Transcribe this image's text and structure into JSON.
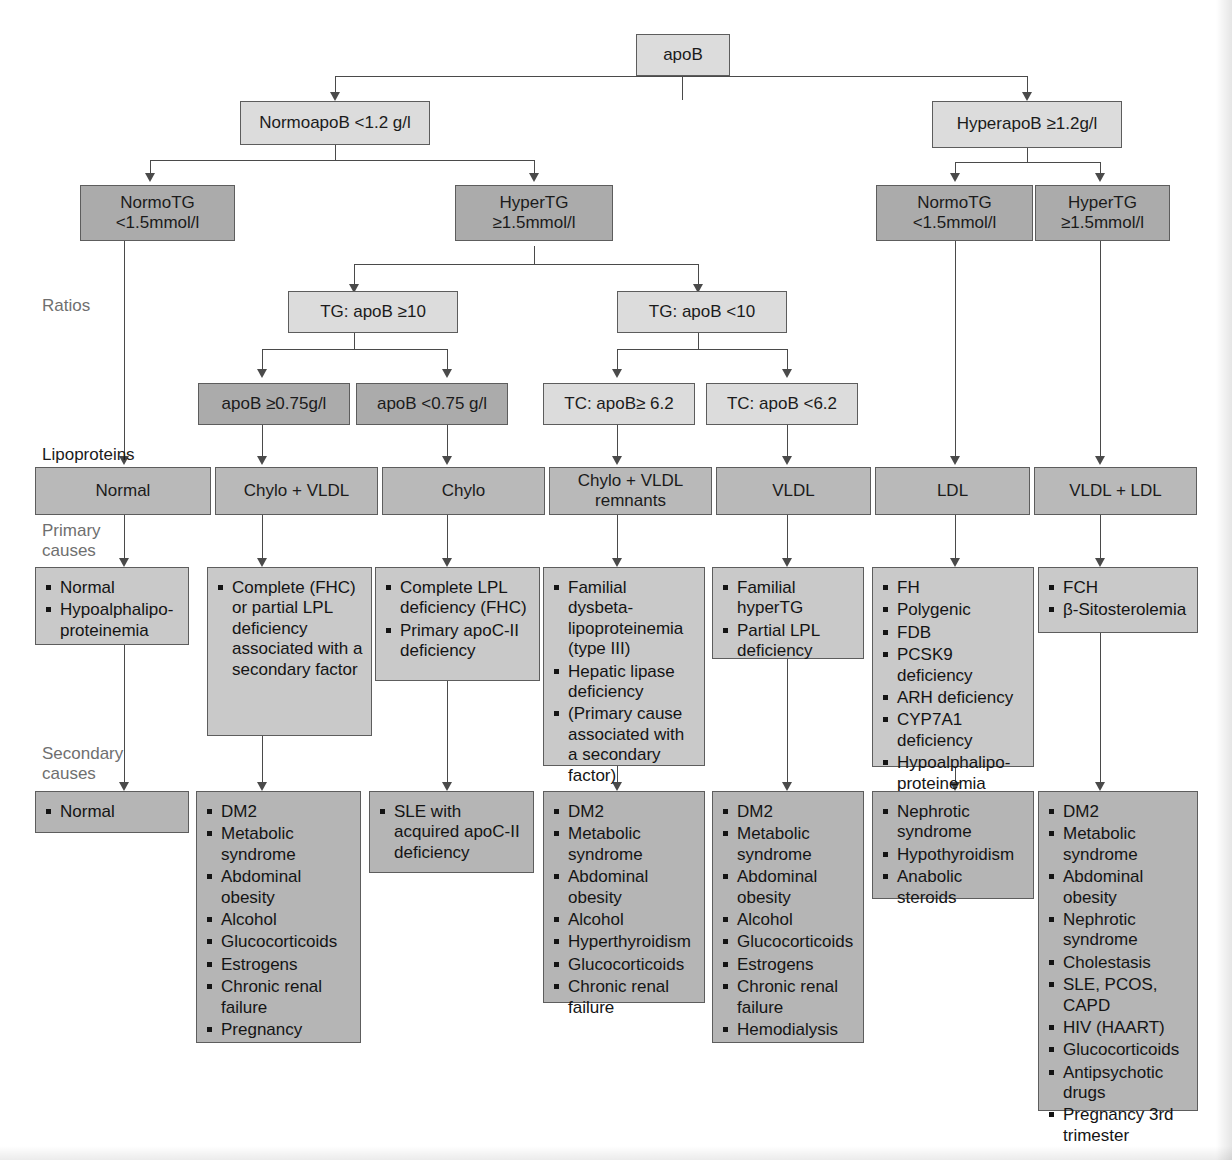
{
  "diagram": {
    "row_labels": {
      "ratios": "Ratios",
      "lipoproteins": "Lipoproteins",
      "primary_causes": "Primary\ncauses",
      "secondary_causes": "Secondary\ncauses"
    },
    "colors": {
      "box_light": "#dcdcdc",
      "box_mid": "#b9b9b9",
      "box_dark": "#ababab",
      "list_primary": "#c9c9c9",
      "list_secondary": "#b5b5b5",
      "border": "#5d5d5d",
      "connector": "#4a4a4a",
      "label_gray": "#6f6f6f"
    },
    "root": {
      "label": "apoB"
    },
    "level_apob": [
      {
        "label": "NormoapoB <1.2 g/l"
      },
      {
        "label": "HyperapoB ≥1.2g/l"
      }
    ],
    "level_tg": [
      {
        "label": "NormoTG\n<1.5mmol/l"
      },
      {
        "label": "HyperTG\n≥1.5mmol/l"
      },
      {
        "label": "NormoTG\n<1.5mmol/l"
      },
      {
        "label": "HyperTG\n≥1.5mmol/l"
      }
    ],
    "level_ratios": [
      {
        "label": "TG: apoB ≥10"
      },
      {
        "label": "TG: apoB <10"
      }
    ],
    "level_subratios": [
      {
        "label": "apoB ≥0.75g/l"
      },
      {
        "label": "apoB <0.75 g/l"
      },
      {
        "label": "TC: apoB≥ 6.2"
      },
      {
        "label": "TC: apoB <6.2"
      }
    ],
    "level_lipoproteins": [
      {
        "label": "Normal"
      },
      {
        "label": "Chylo + VLDL"
      },
      {
        "label": "Chylo"
      },
      {
        "label": "Chylo + VLDL\nremnants"
      },
      {
        "label": "VLDL"
      },
      {
        "label": "LDL"
      },
      {
        "label": "VLDL + LDL"
      }
    ],
    "primary_causes": [
      {
        "items": [
          "Normal",
          "Hypoalphalipo-proteinemia"
        ]
      },
      {
        "items": [
          "Complete (FHC) or partial LPL deficiency associated with a secondary factor"
        ]
      },
      {
        "items": [
          "Complete LPL deficiency (FHC)",
          "Primary apoC-II deficiency"
        ]
      },
      {
        "items": [
          "Familial dysbeta-lipoproteinemia (type III)",
          "Hepatic lipase deficiency",
          "(Primary cause associated with a secondary factor)"
        ]
      },
      {
        "items": [
          "Familial hyperTG",
          "Partial LPL deficiency"
        ]
      },
      {
        "items": [
          "FH",
          "Polygenic",
          "FDB",
          "PCSK9 deficiency",
          "ARH deficiency",
          "CYP7A1 deficiency",
          "Hypoalphalipo-proteinemia"
        ]
      },
      {
        "items": [
          "FCH",
          "β-Sitosterolemia"
        ]
      }
    ],
    "secondary_causes": [
      {
        "items": [
          "Normal"
        ]
      },
      {
        "items": [
          "DM2",
          "Metabolic syndrome",
          "Abdominal obesity",
          "Alcohol",
          "Glucocorticoids",
          "Estrogens",
          "Chronic renal failure",
          "Pregnancy"
        ]
      },
      {
        "items": [
          "SLE with acquired apoC-II deficiency"
        ]
      },
      {
        "items": [
          "DM2",
          "Metabolic syndrome",
          "Abdominal obesity",
          "Alcohol",
          "Hyperthyroidism",
          "Glucocorticoids",
          "Chronic renal failure"
        ]
      },
      {
        "items": [
          "DM2",
          "Metabolic syndrome",
          "Abdominal obesity",
          "Alcohol",
          "Glucocorticoids",
          "Estrogens",
          "Chronic renal failure",
          "Hemodialysis"
        ]
      },
      {
        "items": [
          "Nephrotic syndrome",
          "Hypothyroidism",
          "Anabolic steroids"
        ]
      },
      {
        "items": [
          "DM2",
          "Metabolic syndrome",
          "Abdominal obesity",
          "Nephrotic syndrome",
          "Cholestasis",
          "SLE, PCOS, CAPD",
          "HIV (HAART)",
          "Glucocorticoids",
          "Antipsychotic drugs",
          "Pregnancy 3rd trimester"
        ]
      }
    ]
  }
}
